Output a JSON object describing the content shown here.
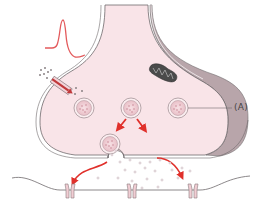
{
  "diagram": {
    "labels": {
      "a": "(A)"
    },
    "components": [
      {
        "id": "presynaptic-terminal",
        "name": "Presynaptic terminal"
      },
      {
        "id": "action-potential",
        "name": "Action potential waveform"
      },
      {
        "id": "ion-channel",
        "name": "Voltage-gated channel with ion influx"
      },
      {
        "id": "mitochondrion",
        "name": "Mitochondrion"
      },
      {
        "id": "synaptic-vesicles",
        "name": "Synaptic vesicles",
        "count": 5
      },
      {
        "id": "exocytosis",
        "name": "Vesicle fusion / neurotransmitter release"
      },
      {
        "id": "postsynaptic-membrane",
        "name": "Postsynaptic membrane"
      },
      {
        "id": "receptors",
        "name": "Postsynaptic receptors",
        "count": 3
      }
    ],
    "colors": {
      "cytoplasm": "#f9e4e8",
      "membrane_outline": "#6e6a6c",
      "thick_membrane": "#b8a5aa",
      "arrow": "#e0302b",
      "vesicle_fill": "#f3d3d8",
      "vesicle_ring": "#9a8a8e",
      "mitochondrion": "#555555",
      "transmitter_dot": "#c9b4bb",
      "receptor": "#f1cdd3"
    }
  }
}
